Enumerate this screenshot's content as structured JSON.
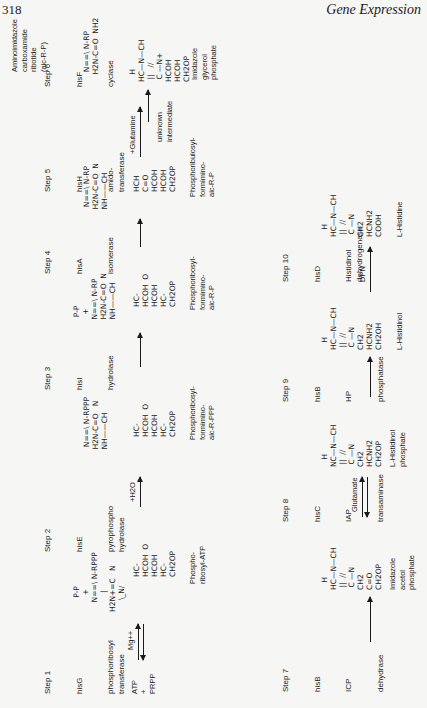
{
  "header": {
    "page_number": "318",
    "running_title": "Gene Expression"
  },
  "steps": [
    {
      "label": "Step 1",
      "gene": "hisG",
      "enzyme": "phosphoribosyl\ntransferase"
    },
    {
      "label": "Step 2",
      "gene": "hisE",
      "enzyme": "pyrophospho\nhydrolase"
    },
    {
      "label": "Step 3",
      "gene": "hisI",
      "enzyme": "hydrolase"
    },
    {
      "label": "Step 4",
      "gene": "hisA",
      "enzyme": "isomerase"
    },
    {
      "label": "Step 5",
      "gene": "hisH",
      "enzyme": "amido-\ntransferase"
    },
    {
      "label": "Step 6",
      "gene": "hisF",
      "enzyme": "cyclase"
    },
    {
      "label": "Step 7",
      "gene": "hisB",
      "code": "ICP",
      "enzyme": "dehydrase"
    },
    {
      "label": "Step 8",
      "gene": "hisC",
      "code": "IAP",
      "enzyme": "transaminase"
    },
    {
      "label": "Step 9",
      "gene": "hisB",
      "code": "HP",
      "enzyme": "phosphatase"
    },
    {
      "label": "Step 10",
      "gene": "hisD",
      "enzyme": "Histidinol\ndehydrogenase"
    }
  ],
  "reactants": {
    "start": "ATP\n+\nPRPP",
    "cofactor": "Mg++",
    "water": "+H2O",
    "glutamine": "+Glutamine",
    "glutamate": "Glutamate",
    "dpn": "DPN"
  },
  "compounds": {
    "pr_atp": "Phospho-\nribosyl-ATP",
    "pr_amp_ppp": "Phosphoribosyl-\nformimino-\naic-R-PPP",
    "pr_formimino": "Phosphoribosyl-\nformimino-\naic-R-P",
    "prbl_formimino": "Phosphoribulosyl-\nformimino-\naic-R-P",
    "aicar": "Aminoimidazole\ncarboxamide\nribotide\n(aic-R-P)",
    "unknown": "unknown\nintermediate",
    "igp": "Imidazole\nglycerol\nphosphate",
    "iap": "Imidazole\nacetol\nphosphate",
    "hol_p": "L-Histidinol\nphosphate",
    "hol": "L-Histidinol",
    "his": "L-Histidine"
  },
  "structures": {
    "s1_ring": "      P-P\n       +\n    N==\\ N-RPPP\n        |\nH2N+=C   N\n     \\_N/",
    "s1_sugar": "HC-\nHCOH  O\nHCOH\nHC-\nCH2OP",
    "s2_ring": "  N==\\ N-RPPP\n H2N-C=O   N\n NH——CH",
    "s2_sugar": "HC-\nHCOH  O\nHCOH\nHC-\nCH2OP",
    "s3_ring": "  P-P\n   +\n N==\\ N-RP\n H2N-C=O  N\n NH——CH",
    "s3_sugar": "HC-\nHCOH  O\nHCOH\nHC-\nCH2OP",
    "s4_ring": "  N==\\ N-RP\n H2N-C=O  N\n NH——CH",
    "s4_chain": "HCH\nC=O\nHCOH\nHCOH\nCH2OP",
    "s6_aicar": "  N==\\ N-RP\n H2N-C=O  NH2",
    "s6_igp": "   H\nHC—N—CH\n ||   //\n C —N+\nHCOH\nHCOH\nCH2OP",
    "imid_iap": "   H\nHC—N—CH\n ||  //\n C —N\nCH2\nC=O\nCH2OP",
    "imid_holp": "   H\nNC—N—CH\n ||  //\n C —N\nCH2\nHCNH2\nCH2OP",
    "imid_hol": "   H\nHC—N—CH\n ||  //\n C —N\nCH2\nHCNH2\nCH2OH",
    "imid_his": "   H\nHC—N—CH\n ||  //\n C —N\nCH2\nHCNH2\nCOOH"
  }
}
